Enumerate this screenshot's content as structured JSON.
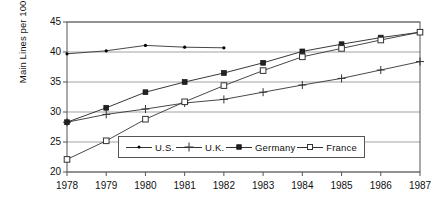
{
  "chart_data": {
    "type": "line",
    "title": "",
    "xlabel": "",
    "ylabel": "Main Lines per 100 Population",
    "categories": [
      1978,
      1979,
      1980,
      1981,
      1982,
      1983,
      1984,
      1985,
      1986,
      1987
    ],
    "xtick_labels": [
      "1978",
      "1979",
      "1980",
      "1981",
      "1982",
      "1983",
      "1984",
      "1985",
      "1986",
      "1987"
    ],
    "ytick_labels": [
      "20",
      "25",
      "30",
      "35",
      "40",
      "45"
    ],
    "yticks": [
      20,
      25,
      30,
      35,
      40,
      45
    ],
    "ylim": [
      20,
      45
    ],
    "xlim": [
      1978,
      1987
    ],
    "grid": "horizontal",
    "legend_position": "inside-lower-center",
    "series": [
      {
        "name": "U.S.",
        "marker": "dot",
        "color": "#333333",
        "x": [
          1978,
          1979,
          1980,
          1981,
          1982
        ],
        "values": [
          39.7,
          40.2,
          41.1,
          40.8,
          40.7
        ]
      },
      {
        "name": "U.K.",
        "marker": "plus",
        "color": "#333333",
        "x": [
          1978,
          1979,
          1980,
          1981,
          1982,
          1983,
          1984,
          1985,
          1986,
          1987
        ],
        "values": [
          28.3,
          29.6,
          30.5,
          31.5,
          32.1,
          33.3,
          34.5,
          35.6,
          37.0,
          38.4
        ]
      },
      {
        "name": "Germany",
        "marker": "filled-square",
        "color": "#222222",
        "x": [
          1978,
          1979,
          1980,
          1981,
          1982,
          1983,
          1984,
          1985,
          1986,
          1987
        ],
        "values": [
          28.3,
          30.7,
          33.3,
          35.0,
          36.5,
          38.2,
          40.1,
          41.3,
          42.4,
          43.3
        ]
      },
      {
        "name": "France",
        "marker": "open-square",
        "color": "#333333",
        "x": [
          1978,
          1979,
          1980,
          1981,
          1982,
          1983,
          1984,
          1985,
          1986,
          1987
        ],
        "values": [
          22.1,
          25.2,
          28.8,
          31.7,
          34.4,
          36.9,
          39.2,
          40.6,
          42.0,
          43.3
        ]
      }
    ],
    "legend": [
      {
        "label": "U.S.",
        "marker": "dot"
      },
      {
        "label": "U.K.",
        "marker": "plus"
      },
      {
        "label": "Germany",
        "marker": "filled-square"
      },
      {
        "label": "France",
        "marker": "open-square"
      }
    ]
  }
}
